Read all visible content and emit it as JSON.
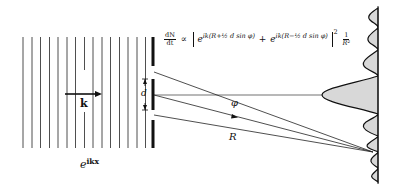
{
  "diagram": {
    "labels": {
      "wave_vector": "k",
      "plane_wave": "e",
      "plane_wave_exp": "ikx",
      "slit_separation": "d",
      "angle": "φ",
      "distance": "R"
    },
    "formula": {
      "lhs_num": "dN",
      "lhs_den": "dt",
      "proportional": "∝",
      "term1_base": "e",
      "term1_exp": "ik(R+½ d sin φ)",
      "plus": "+",
      "term2_base": "e",
      "term2_exp": "ik(R−½ d sin φ)",
      "power": "2",
      "factor_num": "1",
      "factor_den": "R²"
    },
    "colors": {
      "line": "#111111",
      "pattern_fill": "#d8d8d8",
      "background": "#ffffff"
    },
    "geometry": {
      "wavefront_count": 15,
      "wavefront_x_start": 23,
      "wavefront_spacing": 8.7,
      "barrier_x": 153,
      "screen_x": 378,
      "center_y": 95,
      "focus_point": [
        373,
        152
      ]
    }
  }
}
